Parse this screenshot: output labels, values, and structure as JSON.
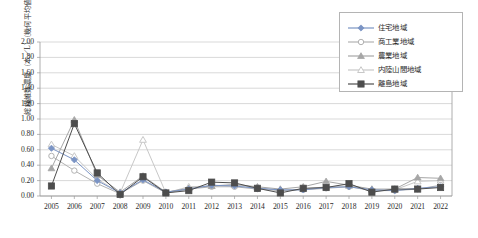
{
  "chart_data": {
    "type": "line",
    "title": "",
    "xlabel": "",
    "ylabel": "総繊維数濃度（本／L）（幾何平均値）",
    "categories": [
      "2005",
      "2006",
      "2007",
      "2008",
      "2009",
      "2010",
      "2011",
      "2012",
      "2013",
      "2014",
      "2015",
      "2016",
      "2017",
      "2018",
      "2019",
      "2020",
      "2021",
      "2022"
    ],
    "ylim": [
      0.0,
      2.0
    ],
    "ytick_step": 0.2,
    "yticks": [
      "0.00",
      "0.20",
      "0.40",
      "0.60",
      "0.80",
      "1.00",
      "1.20",
      "1.40",
      "1.60",
      "1.80",
      "2.00"
    ],
    "grid": true,
    "legend_position": "top-right",
    "series": [
      {
        "name": "住宅地域",
        "marker": "filled-diamond",
        "color": "#7b94c4",
        "values": [
          0.62,
          0.47,
          0.2,
          0.04,
          0.21,
          0.05,
          0.09,
          0.14,
          0.13,
          0.1,
          0.08,
          0.08,
          0.11,
          0.12,
          0.08,
          0.07,
          0.1,
          0.12
        ]
      },
      {
        "name": "商工業地域",
        "marker": "open-circle",
        "color": "#b2b2b2",
        "values": [
          0.52,
          0.33,
          0.16,
          0.03,
          0.2,
          0.04,
          0.09,
          0.12,
          0.12,
          0.09,
          0.07,
          0.08,
          0.1,
          0.12,
          0.07,
          0.07,
          0.09,
          0.14
        ]
      },
      {
        "name": "農業地域",
        "marker": "filled-triangle",
        "color": "#a6a6a6",
        "values": [
          0.36,
          0.99,
          0.27,
          0.05,
          0.26,
          0.05,
          0.1,
          0.13,
          0.15,
          0.12,
          0.09,
          0.12,
          0.19,
          0.14,
          0.09,
          0.09,
          0.24,
          0.23
        ]
      },
      {
        "name": "内陸山間地域",
        "marker": "open-triangle",
        "color": "#c8c8c8",
        "values": [
          0.67,
          0.52,
          0.22,
          0.04,
          0.73,
          0.04,
          0.12,
          0.13,
          0.14,
          0.11,
          0.07,
          0.09,
          0.12,
          0.13,
          0.08,
          0.08,
          0.19,
          0.2
        ]
      },
      {
        "name": "離島地域",
        "marker": "filled-square",
        "color": "#4d4d4d",
        "values": [
          0.13,
          0.94,
          0.3,
          0.02,
          0.25,
          0.04,
          0.07,
          0.18,
          0.17,
          0.1,
          0.04,
          0.1,
          0.11,
          0.16,
          0.05,
          0.09,
          0.09,
          0.11
        ]
      }
    ]
  },
  "axis_colors": {
    "grid": "#c9c9c9",
    "axis": "#9a9a9a",
    "text": "#2b2b2b"
  }
}
